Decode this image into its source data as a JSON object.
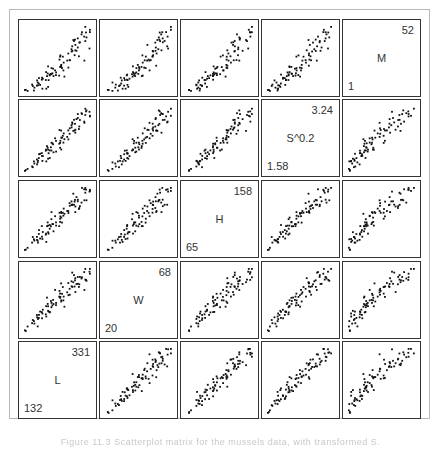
{
  "chart_data": {
    "type": "scatter",
    "title": "Scatterplot matrix",
    "layout": "5x5 scatterplot matrix, diagonal runs bottom-left to top-right",
    "grid": false,
    "variables": [
      {
        "name": "L",
        "min": "132",
        "max": "331"
      },
      {
        "name": "W",
        "min": "20",
        "max": "68"
      },
      {
        "name": "H",
        "min": "65",
        "max": "158"
      },
      {
        "name": "S^0.2",
        "min": "1.58",
        "max": "3.24"
      },
      {
        "name": "M",
        "min": "1",
        "max": "52"
      }
    ],
    "row_order": [
      "M",
      "S^0.2",
      "H",
      "W",
      "L"
    ],
    "col_order": [
      "L",
      "W",
      "H",
      "S^0.2",
      "M"
    ],
    "relationship": "all pairs strongly positively correlated with slight upward curvature",
    "point_count_per_panel": 82
  },
  "diagonal": [
    {
      "row": 0,
      "col": 4,
      "label": "M",
      "max": "52",
      "min": "1"
    },
    {
      "row": 1,
      "col": 3,
      "label": "S^0.2",
      "max": "3.24",
      "min": "1.58"
    },
    {
      "row": 2,
      "col": 2,
      "label": "H",
      "max": "158",
      "min": "65"
    },
    {
      "row": 3,
      "col": 1,
      "label": "W",
      "max": "68",
      "min": "20"
    },
    {
      "row": 4,
      "col": 0,
      "label": "L",
      "max": "331",
      "min": "132"
    }
  ],
  "caption": "Figure 11.3  Scatterplot matrix for the mussels data, with transformed S."
}
